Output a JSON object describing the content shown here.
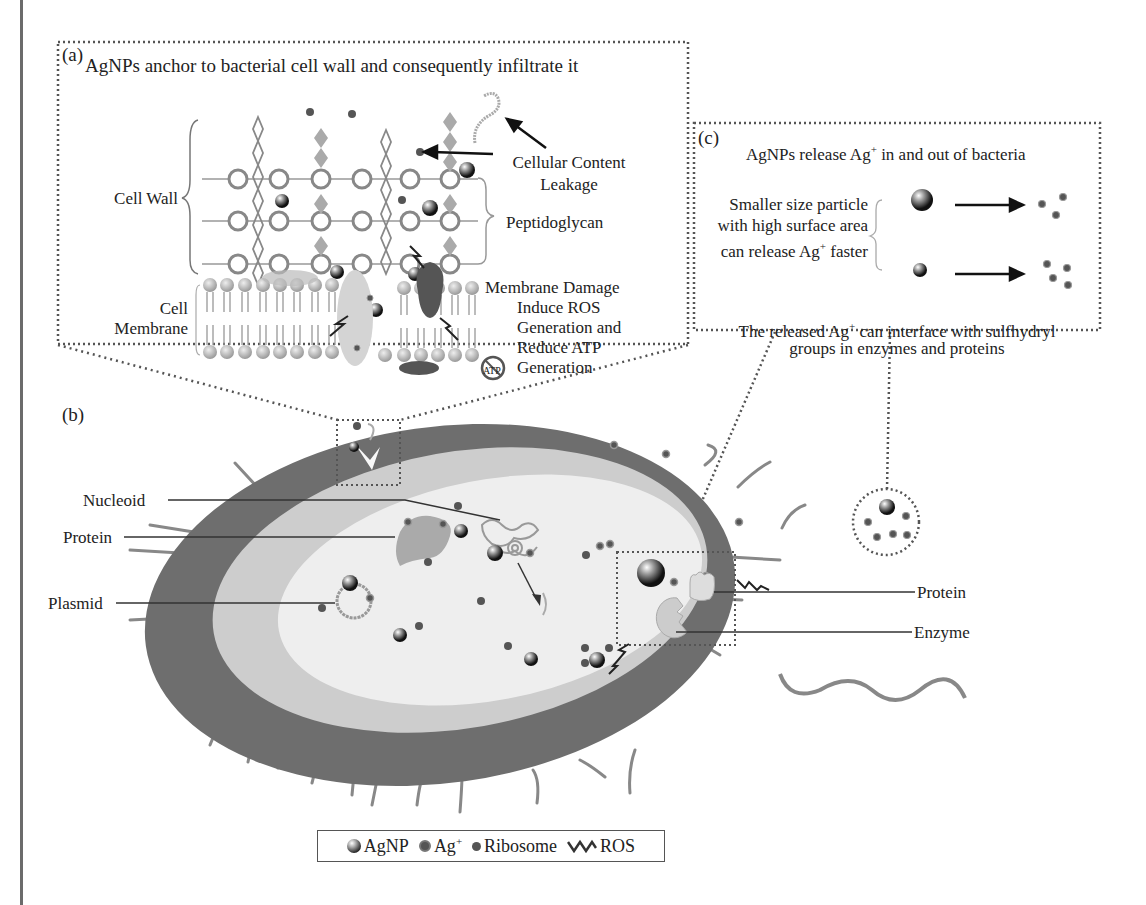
{
  "panel_a": {
    "letter": "(a)",
    "title": "AgNPs anchor to bacterial cell wall and consequently infiltrate it",
    "labels": {
      "cell_wall": "Cell Wall",
      "cell_membrane_1": "Cell",
      "cell_membrane_2": "Membrane",
      "leakage_1": "Cellular Content",
      "leakage_2": "Leakage",
      "peptidoglycan": "Peptidoglycan",
      "damage_1": "Membrane Damage",
      "damage_2": "Induce ROS",
      "damage_3": "Generation and",
      "damage_4": "Reduce ATP",
      "damage_5": "Generation",
      "atp_badge": "ATP"
    }
  },
  "panel_b": {
    "letter": "(b)",
    "labels": {
      "nucleoid": "Nucleoid",
      "protein_left": "Protein",
      "plasmid": "Plasmid",
      "protein_right": "Protein",
      "enzyme": "Enzyme"
    }
  },
  "panel_c": {
    "letter": "(c)",
    "title_pre": "AgNPs release Ag",
    "title_sup": "+",
    "title_post": " in and out of bacteria",
    "size_1": "Smaller size particle",
    "size_2": "with high surface area",
    "size_3_pre": "can release Ag",
    "size_3_sup": "+",
    "size_3_post": " faster",
    "note_1_pre": "The released Ag",
    "note_1_sup": "+",
    "note_1_post": " can interface with sulfhydryl",
    "note_2": "groups in enzymes and proteins"
  },
  "legend": {
    "items": [
      {
        "icon": "agnp-sphere-icon",
        "label": "AgNP"
      },
      {
        "icon": "ag-ion-icon",
        "label": "Ag",
        "sup": "+"
      },
      {
        "icon": "ribosome-dot-icon",
        "label": "Ribosome"
      },
      {
        "icon": "ros-zigzag-icon",
        "label": "ROS"
      }
    ]
  },
  "colors": {
    "cell_wall_outer": "#666666",
    "periplasm": "#cfcfcf",
    "cytoplasm": "#ececec",
    "dotted_border": "#555555",
    "text": "#222222"
  }
}
